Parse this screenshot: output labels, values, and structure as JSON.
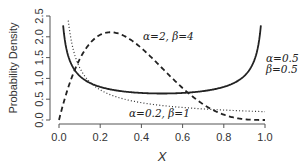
{
  "chart_data": {
    "type": "line",
    "title": "",
    "xlabel": "X",
    "ylabel": "Probability Density",
    "xlim": [
      0.0,
      1.0
    ],
    "ylim": [
      0.0,
      2.5
    ],
    "x_ticks": [
      "0.0",
      "0.2",
      "0.4",
      "0.6",
      "0.8",
      "1.0"
    ],
    "y_ticks": [
      "0.0",
      "0.5",
      "1.0",
      "1.5",
      "2.0",
      "2.5"
    ],
    "grid": false,
    "legend": "none (inline annotations)",
    "series": [
      {
        "name": "α=0.5, β=0.5",
        "distribution": "Beta",
        "alpha": 0.5,
        "beta": 0.5,
        "line_style": "solid",
        "x": [
          0.02,
          0.05,
          0.1,
          0.2,
          0.3,
          0.4,
          0.5,
          0.6,
          0.7,
          0.8,
          0.9,
          0.95,
          0.98
        ],
        "values": [
          2.27,
          1.46,
          1.06,
          0.8,
          0.69,
          0.65,
          0.64,
          0.65,
          0.69,
          0.8,
          1.06,
          1.46,
          2.27
        ]
      },
      {
        "name": "α=2, β=4",
        "distribution": "Beta",
        "alpha": 2,
        "beta": 4,
        "line_style": "dashed",
        "x": [
          0.0,
          0.05,
          0.1,
          0.2,
          0.25,
          0.3,
          0.4,
          0.5,
          0.6,
          0.7,
          0.8,
          0.9,
          1.0
        ],
        "values": [
          0.0,
          0.86,
          1.46,
          2.05,
          2.11,
          2.06,
          1.73,
          1.25,
          0.77,
          0.38,
          0.13,
          0.02,
          0.0
        ]
      },
      {
        "name": "α=0.2, β=1",
        "distribution": "Beta",
        "alpha": 0.2,
        "beta": 1,
        "line_style": "dotted",
        "x": [
          0.05,
          0.1,
          0.2,
          0.3,
          0.4,
          0.5,
          0.6,
          0.7,
          0.8,
          0.9,
          1.0
        ],
        "values": [
          2.2,
          1.26,
          0.72,
          0.53,
          0.42,
          0.35,
          0.3,
          0.27,
          0.24,
          0.22,
          0.2
        ]
      }
    ],
    "annotations": [
      {
        "text": "α=2, β=4",
        "x": 0.52,
        "y": 2.05
      },
      {
        "text": "α=0.5",
        "x": 1.06,
        "y": 1.55
      },
      {
        "text": "β=0.5",
        "x": 1.06,
        "y": 1.3
      },
      {
        "text": "α=0.2, β=1",
        "x": 0.45,
        "y": 0.1
      }
    ]
  },
  "labels": {
    "ylabel": "Probability Density",
    "xlabel": "X",
    "ann1": "α=2, β=4",
    "ann2a": "α=0.5",
    "ann2b": "β=0.5",
    "ann3": "α=0.2, β=1"
  }
}
